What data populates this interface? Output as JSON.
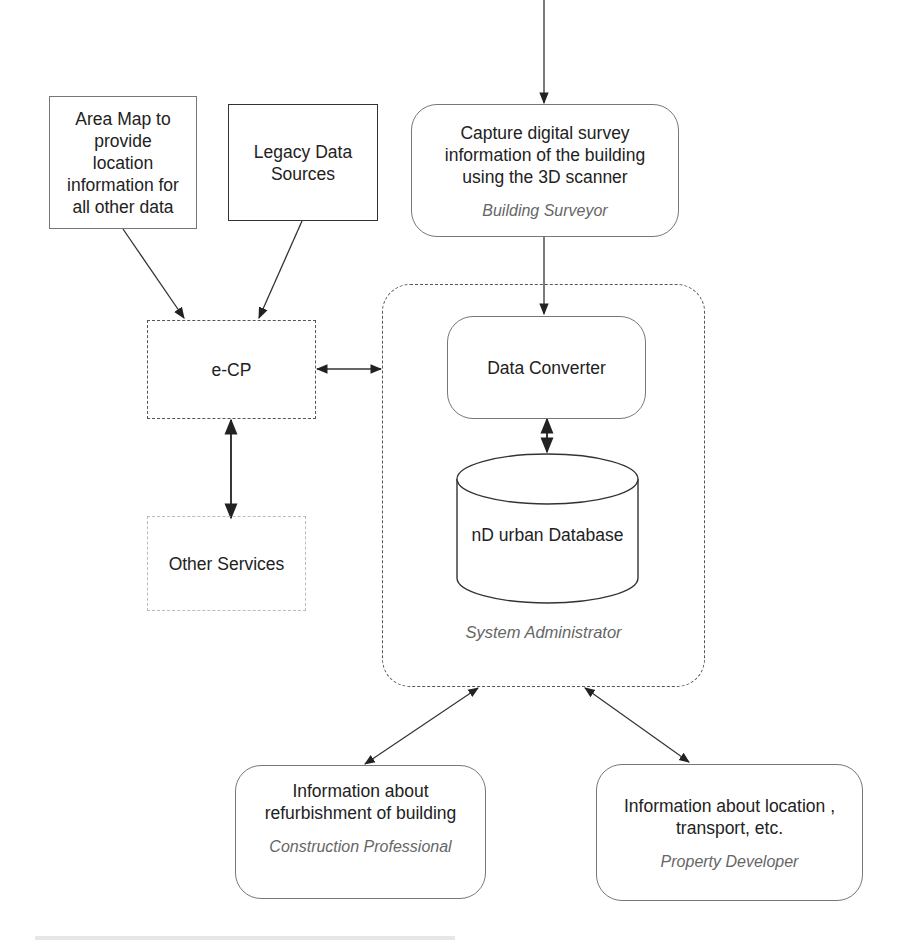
{
  "diagram": {
    "nodes": {
      "area_map": {
        "lines": [
          "Area Map to",
          "provide",
          "location",
          "information for",
          "all other data"
        ]
      },
      "legacy": {
        "lines": [
          "Legacy Data",
          "Sources"
        ]
      },
      "capture": {
        "lines": [
          "Capture digital survey",
          "information of the building",
          "using the 3D scanner"
        ],
        "role": "Building Surveyor"
      },
      "ecp": {
        "label": "e-CP"
      },
      "other_services": {
        "label": "Other Services"
      },
      "data_converter": {
        "label": "Data Converter"
      },
      "database": {
        "label": "nD urban Database"
      },
      "system_admin_group": {
        "role": "System Administrator"
      },
      "construction": {
        "lines": [
          "Information about",
          "refurbishment of building"
        ],
        "role": "Construction Professional"
      },
      "property": {
        "lines": [
          "Information about location ,",
          "transport, etc."
        ],
        "role": "Property Developer"
      }
    },
    "edges": [
      {
        "from": "external-top",
        "to": "capture",
        "type": "arrow"
      },
      {
        "from": "area_map",
        "to": "ecp",
        "type": "arrow"
      },
      {
        "from": "legacy",
        "to": "ecp",
        "type": "arrow"
      },
      {
        "from": "capture",
        "to": "data_converter",
        "type": "arrow"
      },
      {
        "from": "ecp",
        "to": "system_admin_group",
        "type": "bidirectional"
      },
      {
        "from": "ecp",
        "to": "other_services",
        "type": "bidirectional"
      },
      {
        "from": "data_converter",
        "to": "database",
        "type": "bidirectional"
      },
      {
        "from": "system_admin_group",
        "to": "construction",
        "type": "bidirectional"
      },
      {
        "from": "system_admin_group",
        "to": "property",
        "type": "bidirectional"
      }
    ]
  }
}
